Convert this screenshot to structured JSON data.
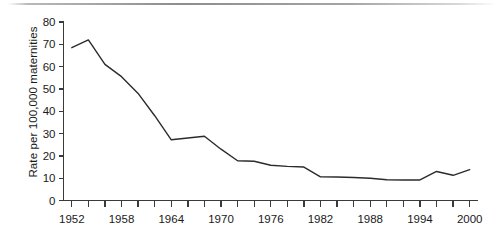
{
  "chart_data": {
    "type": "line",
    "title": "",
    "xlabel": "",
    "ylabel": "Rate per 100,000 maternities",
    "xlim": [
      1951,
      2001
    ],
    "ylim": [
      0,
      80
    ],
    "ytick_values": [
      0,
      10,
      20,
      30,
      40,
      50,
      60,
      70,
      80
    ],
    "ytick_labels": [
      "0",
      "10",
      "20",
      "30",
      "40",
      "50",
      "60",
      "70",
      "80"
    ],
    "xtick_labels": [
      "1952",
      "1958",
      "1964",
      "1970",
      "1976",
      "1982",
      "1988",
      "1994",
      "2000"
    ],
    "xtick_values": [
      1952,
      1958,
      1964,
      1970,
      1976,
      1982,
      1988,
      1994,
      2000
    ],
    "minor_tick_interval": 2,
    "grid": false,
    "legend": null,
    "line_color": "#2b2b2b",
    "line_width": 1.4,
    "series": [
      {
        "name": "Maternal mortality rate",
        "x": [
          1952,
          1954,
          1956,
          1958,
          1960,
          1962,
          1964,
          1966,
          1968,
          1970,
          1972,
          1974,
          1976,
          1978,
          1980,
          1982,
          1984,
          1986,
          1988,
          1990,
          1992,
          1994,
          1996,
          1998,
          2000
        ],
        "values": [
          68.5,
          72.0,
          61.0,
          55.5,
          48.0,
          38.0,
          27.2,
          28.0,
          28.8,
          23.0,
          17.8,
          17.6,
          15.8,
          15.3,
          15.0,
          10.6,
          10.5,
          10.3,
          10.0,
          9.3,
          9.2,
          9.2,
          13.0,
          11.3,
          13.8
        ]
      }
    ]
  },
  "axis": {
    "y_title": "Rate per 100,000 maternities"
  }
}
